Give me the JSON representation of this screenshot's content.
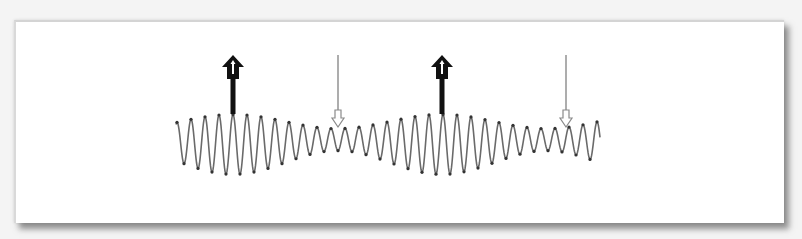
{
  "diagram": {
    "type": "beat-frequency-waveform",
    "colors": {
      "background": "#f4f4f4",
      "card": "#ffffff",
      "wave": "#6a6a6a",
      "wave_points": "#333333",
      "strong_arrow": "#111111",
      "weak_arrow": "#8a8a8a"
    },
    "wave": {
      "x_start": 176,
      "x_end": 600,
      "carrier_period_px": 14,
      "envelope_period_px": 209,
      "first_max_x": 233,
      "center_y": 145,
      "max_half_amplitude": 30,
      "min_half_amplitude": 11
    },
    "markers": [
      {
        "kind": "constructive",
        "direction": "up",
        "style": "thick",
        "x": 233,
        "label": ""
      },
      {
        "kind": "destructive",
        "direction": "down",
        "style": "thin",
        "x": 338,
        "label": ""
      },
      {
        "kind": "constructive",
        "direction": "up",
        "style": "thick",
        "x": 442,
        "label": ""
      },
      {
        "kind": "destructive",
        "direction": "down",
        "style": "thin",
        "x": 566,
        "label": ""
      }
    ]
  }
}
